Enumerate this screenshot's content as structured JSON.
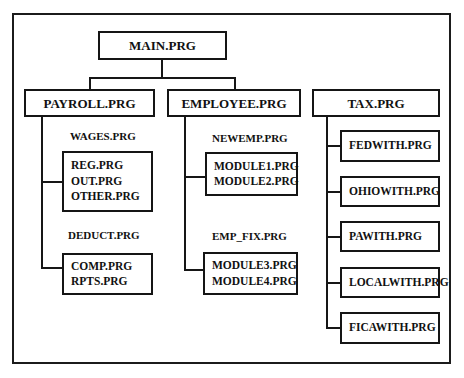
{
  "diagram": {
    "root": {
      "label": "MAIN.PRG"
    },
    "level1": [
      {
        "label": "PAYROLL.PRG"
      },
      {
        "label": "EMPLOYEE.PRG"
      },
      {
        "label": "TAX.PRG"
      }
    ],
    "payroll": {
      "group1_caption": "WAGES.PRG",
      "group1_items": [
        "REG.PRG",
        "OUT.PRG",
        "OTHER.PRG"
      ],
      "group2_caption": "DEDUCT.PRG",
      "group2_items": [
        "COMP.PRG",
        "RPTS.PRG"
      ]
    },
    "employee": {
      "group1_caption": "NEWEMP.PRG",
      "group1_items": [
        "MODULE1.PRG",
        "MODULE2.PRG"
      ],
      "group2_caption": "EMP_FIX.PRG",
      "group2_items": [
        "MODULE3.PRG",
        "MODULE4.PRG"
      ]
    },
    "tax": {
      "items": [
        {
          "label": "FEDWITH.PRG"
        },
        {
          "label": "OHIOWITH.PRG"
        },
        {
          "label": "PAWITH.PRG"
        },
        {
          "label": "LOCALWITH.PRG"
        },
        {
          "label": "FICAWITH.PRG"
        }
      ]
    },
    "colors": {
      "line": "#161616",
      "text": "#111111",
      "background": "#ffffff"
    }
  }
}
